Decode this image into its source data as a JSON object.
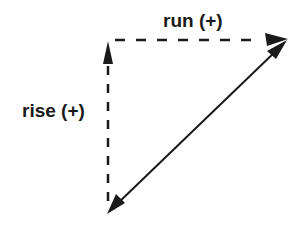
{
  "diagram": {
    "labels": {
      "run": "run (+)",
      "rise": "rise (+)"
    },
    "colors": {
      "stroke": "#1a1a1a",
      "background": "#ffffff"
    },
    "elements": {
      "rise_arrow": {
        "style": "dashed",
        "direction": "up",
        "from": [
          108,
          200
        ],
        "to": [
          108,
          42
        ]
      },
      "run_arrow": {
        "style": "dashed",
        "direction": "right",
        "from": [
          114,
          40
        ],
        "to": [
          287,
          40
        ]
      },
      "hypotenuse_arrow": {
        "style": "solid",
        "direction": "bidirectional",
        "from": [
          107,
          214
        ],
        "to": [
          287,
          40
        ]
      }
    }
  }
}
